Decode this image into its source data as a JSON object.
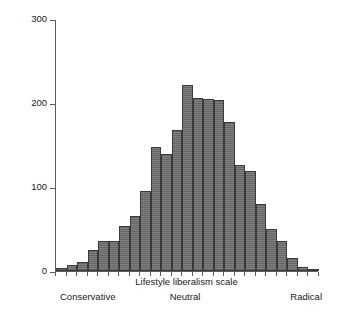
{
  "chart_data": {
    "type": "bar",
    "title": "",
    "subtitle": "",
    "xlabel": "Lifestyle liberalism scale",
    "ylabel": "No of respondents",
    "ylim": [
      0,
      300
    ],
    "yticks": [
      0,
      100,
      200,
      300
    ],
    "ytick_labels": [
      "0",
      "100",
      "200",
      "300"
    ],
    "grid": false,
    "legend": false,
    "legend_position": "none",
    "bar_color": "#737373",
    "bar_edge_color": "#3a3a3a",
    "axis_color": "#5c5c5c",
    "x_anchor_labels": [
      "Conservative",
      "Neutral",
      "Radical"
    ],
    "n_bars": 25,
    "categories": [
      "1",
      "2",
      "3",
      "4",
      "5",
      "6",
      "7",
      "8",
      "9",
      "10",
      "11",
      "12",
      "13",
      "14",
      "15",
      "16",
      "17",
      "18",
      "19",
      "20",
      "21",
      "22",
      "23",
      "24",
      "25"
    ],
    "values": [
      3,
      7,
      11,
      25,
      36,
      36,
      54,
      66,
      95,
      148,
      139,
      168,
      222,
      206,
      205,
      204,
      177,
      126,
      119,
      80,
      50,
      36,
      15,
      5,
      2
    ],
    "peak_value": 222,
    "peak_category": "13"
  },
  "axis": {
    "y_label": "No of respondents",
    "x_label": "Lifestyle liberalism scale"
  },
  "anchors": {
    "left": "Conservative",
    "middle": "Neutral",
    "right": "Radical"
  }
}
